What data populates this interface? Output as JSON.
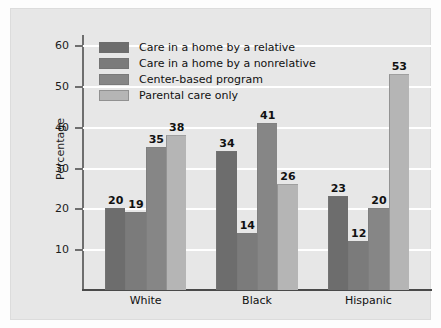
{
  "chart_data": {
    "type": "bar",
    "title": "",
    "xlabel": "",
    "ylabel": "Percentage",
    "ylim": [
      0,
      62
    ],
    "yticks": [
      10,
      20,
      30,
      40,
      50,
      60
    ],
    "grid": true,
    "legend_position": "top-left inside plot",
    "categories": [
      "White",
      "Black",
      "Hispanic"
    ],
    "series": [
      {
        "name": "Care in a home by a relative",
        "color": "#6d6d6d",
        "values": [
          20,
          34,
          23
        ]
      },
      {
        "name": "Care in a home by a nonrelative",
        "color": "#7b7b7b",
        "values": [
          19,
          14,
          12
        ]
      },
      {
        "name": "Center-based program",
        "color": "#868686",
        "values": [
          35,
          41,
          20
        ]
      },
      {
        "name": "Parental care only",
        "color": "#b5b5b5",
        "values": [
          38,
          26,
          53
        ]
      }
    ]
  },
  "colors": {
    "card_background": "#e7e7e7",
    "gridline": "#ffffff",
    "axis": "#6e6e6e",
    "baseline": "#4a4a4a",
    "text": "#111111"
  }
}
